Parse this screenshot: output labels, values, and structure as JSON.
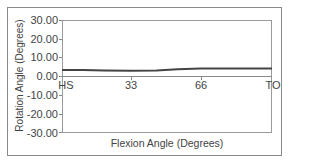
{
  "chart_data": {
    "type": "line",
    "title": "",
    "xlabel": "Flexion Angle (Degrees)",
    "ylabel": "Rotation Angle (Degrees)",
    "ylim": [
      -30,
      30
    ],
    "yticks": [
      "30.00",
      "20.00",
      "10.00",
      "0.00",
      "-10.00",
      "-20.00",
      "-30.00"
    ],
    "xticks": [
      "HS",
      "33",
      "66",
      "TO"
    ],
    "grid": false,
    "legend": null,
    "x": [
      0,
      10,
      20,
      33,
      45,
      55,
      66,
      80,
      100
    ],
    "series": [
      {
        "name": "Rotation",
        "color": "#444444",
        "values": [
          3.5,
          3.4,
          3.2,
          3.0,
          3.2,
          3.8,
          4.2,
          4.2,
          4.2
        ]
      }
    ]
  },
  "axes": {
    "y_labels": [
      "30.00",
      "20.00",
      "10.00",
      "0.00",
      "-10.00",
      "-20.00",
      "-30.00"
    ],
    "x_labels": [
      "HS",
      "33",
      "66",
      "TO"
    ],
    "xlabel": "Flexion Angle (Degrees)",
    "ylabel": "Rotation Angle (Degrees)"
  },
  "colors": {
    "line": "#444444",
    "axis": "#9a9a9a",
    "frame": "#8a8a8a"
  }
}
